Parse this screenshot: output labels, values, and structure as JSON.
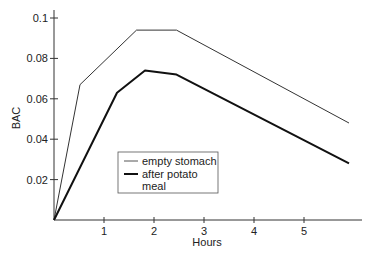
{
  "chart_data": {
    "type": "line",
    "title": "",
    "xlabel": "Hours",
    "ylabel": "BAC",
    "xlim": [
      0,
      6.1
    ],
    "ylim": [
      0,
      0.1
    ],
    "xticks": [
      1,
      2,
      3,
      4,
      5
    ],
    "xtick_labels": [
      "1",
      "2",
      "3",
      "4",
      "5"
    ],
    "yticks": [
      0.02,
      0.04,
      0.06,
      0.08,
      0.1
    ],
    "ytick_labels": [
      "0.02",
      "0.04",
      "0.06",
      "0.08",
      "0.1"
    ],
    "grid": false,
    "legend_position": "center-left inside plot",
    "series": [
      {
        "name": "empty stomach",
        "style": "thin",
        "color": "#333333",
        "points": [
          [
            0,
            0
          ],
          [
            0.52,
            0.067
          ],
          [
            1.65,
            0.094
          ],
          [
            2.45,
            0.094
          ],
          [
            5.9,
            0.048
          ]
        ]
      },
      {
        "name": "after potato meal",
        "style": "thick",
        "color": "#111111",
        "points": [
          [
            0,
            0
          ],
          [
            1.26,
            0.063
          ],
          [
            1.82,
            0.074
          ],
          [
            2.45,
            0.072
          ],
          [
            5.9,
            0.028
          ]
        ]
      }
    ]
  },
  "legend": {
    "line1": "empty stomach",
    "line2a": "after potato",
    "line2b": "meal"
  }
}
